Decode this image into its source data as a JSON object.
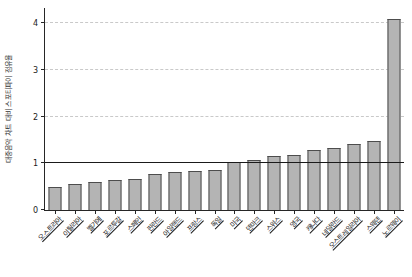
{
  "chart_data": {
    "type": "bar",
    "title": "",
    "xlabel": "",
    "ylabel": "대중음악 차트 대비 스포티파이 점유율",
    "categories": [
      "오스트리아",
      "이탈리아",
      "벨기에",
      "포르투갈",
      "스페인",
      "핀란드",
      "아일랜드",
      "프랑스",
      "독일",
      "미국",
      "덴마크",
      "스위스",
      "영국",
      "캐나다",
      "네덜란드",
      "오스트레일리아",
      "스웨덴",
      "노르웨이"
    ],
    "values": [
      0.5,
      0.55,
      0.61,
      0.64,
      0.66,
      0.78,
      0.81,
      0.84,
      0.86,
      1.02,
      1.08,
      1.15,
      1.19,
      1.28,
      1.33,
      1.41,
      1.47,
      4.1
    ],
    "ylim": [
      0,
      4.33
    ],
    "yticks": [
      0,
      1,
      2,
      3,
      4
    ],
    "gridlines": [
      2,
      3,
      4
    ],
    "grid_style": "dashed",
    "reference_line": 1,
    "legend": null,
    "colors": {
      "bar_fill": "#b4b4b4",
      "bar_edge": "#4d4d4d",
      "grid": "#c9c9c9",
      "reference_line": "#1a1a1a",
      "axis": "#262626",
      "text": "#1a1a1a",
      "background": "#ffffff"
    }
  }
}
